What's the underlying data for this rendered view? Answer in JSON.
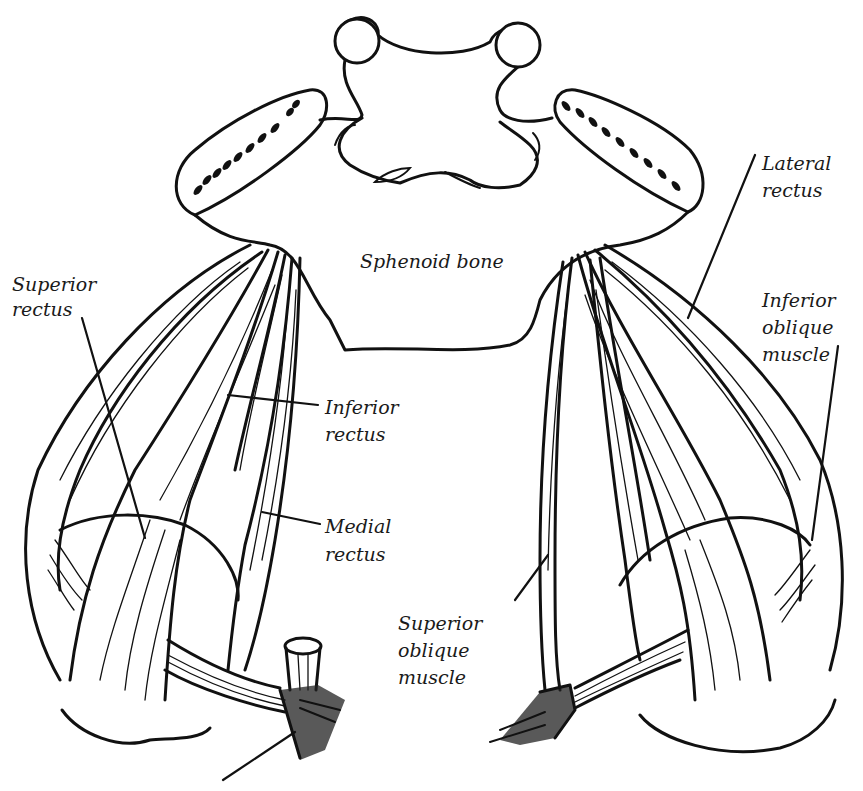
{
  "figure": {
    "colors": {
      "ink": "#111111",
      "background": "#ffffff"
    }
  },
  "labels": {
    "sphenoid": "Sphenoid bone",
    "superior_rectus": [
      "Superior",
      "rectus"
    ],
    "inferior_rectus": [
      "Inferior",
      "rectus"
    ],
    "medial_rectus": [
      "Medial",
      "rectus"
    ],
    "lateral_rectus": [
      "Lateral",
      "rectus"
    ],
    "inferior_oblique": [
      "Inferior",
      "oblique",
      "muscle"
    ],
    "superior_oblique": [
      "Superior",
      "oblique",
      "muscle"
    ]
  }
}
